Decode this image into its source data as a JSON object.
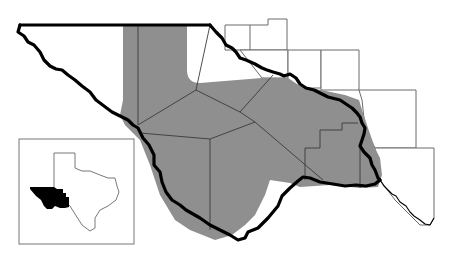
{
  "map": {
    "type": "regional locator map",
    "region_description": "Trans-Pecos / West Texas counties along the Rio Grande",
    "colors": {
      "background": "#ffffff",
      "shaded_region": "#8f8f8f",
      "unshaded_region": "#ffffff",
      "river_border": "#000000",
      "county_lines": "#3a3a3a",
      "inset_highlight": "#000000"
    },
    "legend": [],
    "labels": [],
    "inset": {
      "depicts": "State of Texas outline",
      "highlighted_area": "far West Texas (Trans-Pecos)",
      "highlight_color": "#000000"
    }
  }
}
